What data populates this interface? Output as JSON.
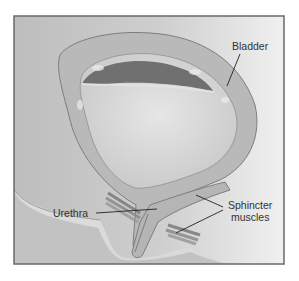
{
  "figure": {
    "type": "anatomical-illustration",
    "subject": "bladder",
    "colors": {
      "background": "#c4c4c4",
      "frame": "#6a6a6a",
      "bladder_wall": "#b9b9b9",
      "bladder_lumen": "#d6d6d6",
      "urine_dark": "#6e6e6e",
      "urethra": "#b5b5b5",
      "muscle": "#8a8a8a",
      "label_text": "#333333"
    }
  },
  "labels": {
    "bladder": "Bladder",
    "urethra": "Urethra",
    "sphincter_line1": "Sphincter",
    "sphincter_line2": "muscles"
  }
}
